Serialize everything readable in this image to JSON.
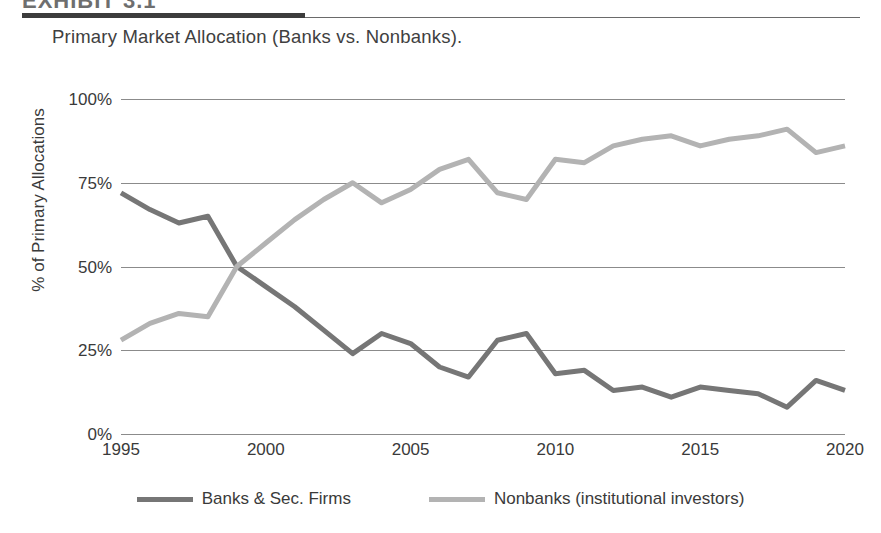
{
  "header": {
    "exhibit_label": "EXHIBIT 3.1",
    "subtitle": "Primary Market Allocation (Banks vs. Nonbanks)."
  },
  "colors": {
    "banks": "#767676",
    "nonbanks": "#b3b3b3",
    "grid": "#8b8b8b",
    "text": "#3a3a3a",
    "rule_thick": "#3c3c3c"
  },
  "chart_data": {
    "type": "line",
    "title": "Primary Market Allocation (Banks vs. Nonbanks).",
    "xlabel": "",
    "ylabel": "% of Primary Allocations",
    "xlim": [
      1995,
      2020
    ],
    "ylim": [
      0,
      100
    ],
    "grid": true,
    "legend_position": "bottom",
    "ytick_labels": [
      "100%",
      "75%",
      "50%",
      "25%",
      "0%"
    ],
    "ytick_values": [
      100,
      75,
      50,
      25,
      0
    ],
    "xtick_labels": [
      "1995",
      "2000",
      "2005",
      "2010",
      "2015",
      "2020"
    ],
    "xtick_values": [
      1995,
      2000,
      2005,
      2010,
      2015,
      2020
    ],
    "x": [
      1995,
      1996,
      1997,
      1998,
      1999,
      2000,
      2001,
      2002,
      2003,
      2004,
      2005,
      2006,
      2007,
      2008,
      2009,
      2010,
      2011,
      2012,
      2013,
      2014,
      2015,
      2016,
      2017,
      2018,
      2019,
      2020
    ],
    "series": [
      {
        "name": "Banks & Sec. Firms",
        "color": "#767676",
        "values": [
          72,
          67,
          63,
          65,
          50,
          44,
          38,
          31,
          24,
          30,
          27,
          20,
          17,
          28,
          30,
          18,
          19,
          13,
          14,
          11,
          14,
          13,
          12,
          8,
          16,
          13
        ]
      },
      {
        "name": "Nonbanks (institutional investors)",
        "color": "#b3b3b3",
        "values": [
          28,
          33,
          36,
          35,
          50,
          57,
          64,
          70,
          75,
          69,
          73,
          79,
          82,
          72,
          70,
          82,
          81,
          86,
          88,
          89,
          86,
          88,
          89,
          91,
          84,
          86
        ]
      }
    ]
  },
  "legend": {
    "items": [
      {
        "label": "Banks & Sec. Firms",
        "color": "#767676"
      },
      {
        "label": "Nonbanks (institutional investors)",
        "color": "#b3b3b3"
      }
    ]
  }
}
